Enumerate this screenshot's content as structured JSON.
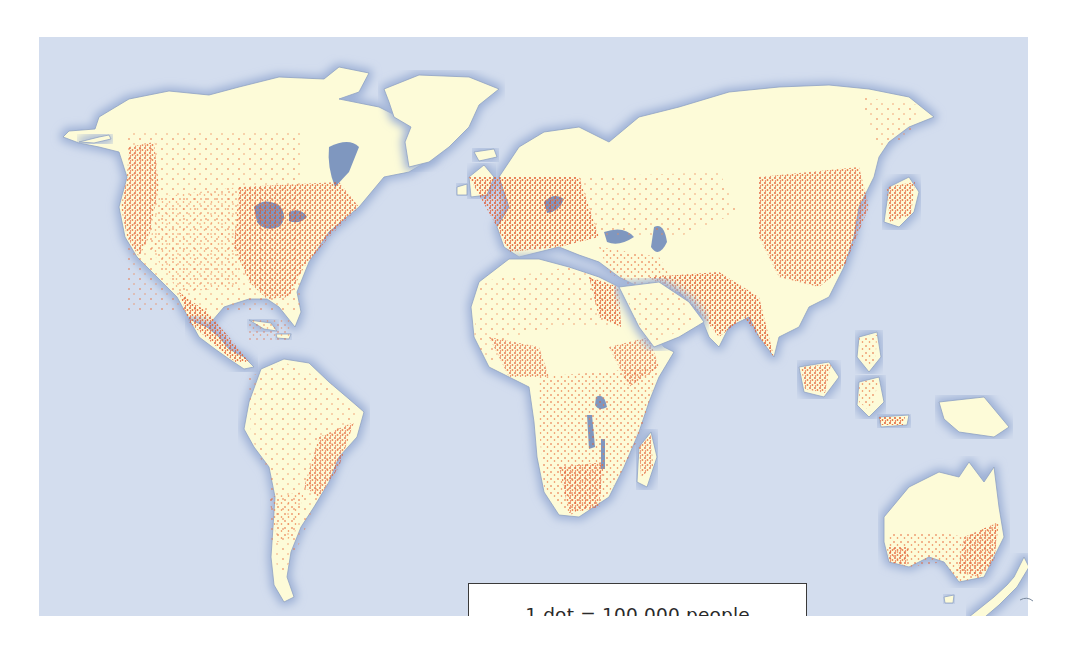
{
  "map": {
    "type": "dot-density world population map",
    "colors": {
      "ocean": "#d3ddee",
      "land": "#fdfbd8",
      "coast_shadow": "#8fa2c4",
      "lakes": "#7f97bf",
      "dots": "#e0502a"
    },
    "regions": [
      {
        "name": "North America",
        "density": "high in east and west coasts"
      },
      {
        "name": "Central America & Caribbean",
        "density": "high"
      },
      {
        "name": "South America",
        "density": "coastal, high in southeast"
      },
      {
        "name": "Europe",
        "density": "very high"
      },
      {
        "name": "Africa",
        "density": "high in Nile, west coast, east and south"
      },
      {
        "name": "Middle East",
        "density": "moderate"
      },
      {
        "name": "South Asia",
        "density": "very high"
      },
      {
        "name": "East Asia",
        "density": "very high"
      },
      {
        "name": "Southeast Asia",
        "density": "high"
      },
      {
        "name": "Australia",
        "density": "east and southwest coasts"
      },
      {
        "name": "Greenland",
        "density": "none"
      }
    ]
  },
  "legend": {
    "text": "1 dot = 100 000 people"
  }
}
